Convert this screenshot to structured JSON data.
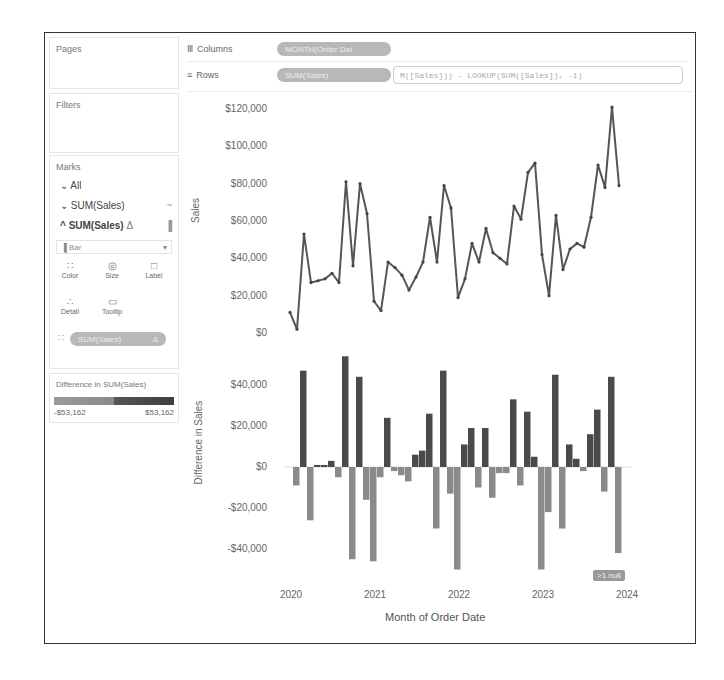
{
  "left_pane": {
    "pages_title": "Pages",
    "filters_title": "Filters",
    "marks": {
      "title": "Marks",
      "all_label": "All",
      "line_layer": {
        "label": "SUM(Sales)",
        "icon": "line-icon",
        "glyph": "~"
      },
      "bar_layer": {
        "label": "SUM(Sales)",
        "delta": "Δ",
        "icon": "bar-icon",
        "glyph": "▐"
      },
      "mark_type": {
        "value": "Bar",
        "glyph": "▐"
      },
      "buttons": [
        {
          "name": "color",
          "label": "Color",
          "glyph": "∷"
        },
        {
          "name": "size",
          "label": "Size",
          "glyph": "◎"
        },
        {
          "name": "label",
          "label": "Label",
          "glyph": "□"
        },
        {
          "name": "detail",
          "label": "Detail",
          "glyph": "∴"
        },
        {
          "name": "tooltip",
          "label": "Tooltip",
          "glyph": "▭"
        }
      ],
      "color_pill": {
        "label": "SUM(Sales)",
        "delta": "Δ",
        "glyph": "∷"
      }
    },
    "legend": {
      "title": "Difference in SUM(Sales)",
      "min_label": "-$53,162",
      "max_label": "$53,162",
      "colors": {
        "negative": "#8a8a8a",
        "positive": "#4a4a4a"
      }
    }
  },
  "shelves": {
    "columns": {
      "label": "Columns",
      "glyph": "Ⅲ",
      "pill": "MONTH(Order Dat"
    },
    "rows": {
      "label": "Rows",
      "glyph": "≡",
      "pill": "SUM(Sales)",
      "calc": "M([Sales])) - LOOKUP(SUM([Sales]), -1)"
    }
  },
  "null_indicator": ">1 null",
  "chart_data": [
    {
      "type": "line",
      "title": "",
      "xlabel": "",
      "ylabel": "Sales",
      "ylim": [
        0,
        120000
      ],
      "yticks": [
        "$0",
        "$20,000",
        "$40,000",
        "$60,000",
        "$80,000",
        "$100,000",
        "$120,000"
      ],
      "ytick_values": [
        0,
        20000,
        40000,
        60000,
        80000,
        100000,
        120000
      ],
      "x_start": "2020-01",
      "values": [
        11000,
        2000,
        53000,
        27000,
        28000,
        29000,
        32000,
        27000,
        81000,
        36000,
        80000,
        64000,
        17000,
        12000,
        38000,
        35000,
        31000,
        23000,
        30000,
        38000,
        62000,
        38000,
        79000,
        67000,
        19000,
        29000,
        48000,
        38000,
        56000,
        43000,
        40000,
        37000,
        68000,
        61000,
        86000,
        91000,
        42000,
        20000,
        63000,
        34000,
        45000,
        48000,
        46000,
        62000,
        90000,
        78000,
        121000,
        79000
      ],
      "color": "#555555"
    },
    {
      "type": "bar",
      "title": "",
      "xlabel": "Month of Order Date",
      "ylabel": "Difference in Sales",
      "ylim": [
        -53162,
        53162
      ],
      "yticks": [
        "-$40,000",
        "-$20,000",
        "$0",
        "$20,000",
        "$40,000"
      ],
      "ytick_values": [
        -40000,
        -20000,
        0,
        20000,
        40000
      ],
      "xticks": [
        "2020",
        "2021",
        "2022",
        "2023",
        "2024"
      ],
      "x_start": "2020-01",
      "values": [
        -9000,
        47000,
        -26000,
        1000,
        1000,
        3000,
        -5000,
        54000,
        -45000,
        44000,
        -16000,
        -46000,
        -5000,
        24000,
        -2000,
        -4000,
        -7000,
        6000,
        8000,
        26000,
        -30000,
        47000,
        -13000,
        -50000,
        11000,
        19000,
        -10000,
        19000,
        -15000,
        -3000,
        -3000,
        33000,
        -9000,
        27000,
        5000,
        -50000,
        -22000,
        45000,
        -30000,
        11000,
        4000,
        -2000,
        16000,
        28000,
        -12000,
        44000,
        -42000
      ],
      "colors": {
        "positive": "#4a4a4a",
        "negative": "#8a8a8a"
      }
    }
  ]
}
